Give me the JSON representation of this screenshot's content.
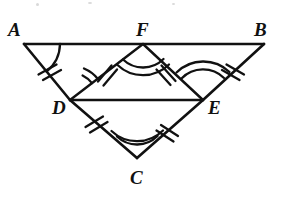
{
  "figure": {
    "stroke_color": "#111111",
    "background_color": "#ffffff",
    "points": {
      "A": {
        "x": 24,
        "y": 44,
        "label": "A",
        "label_x": 8,
        "label_y": 20
      },
      "B": {
        "x": 264,
        "y": 44,
        "label": "B",
        "label_x": 254,
        "label_y": 20
      },
      "C": {
        "x": 137,
        "y": 158,
        "label": "C",
        "label_x": 130,
        "label_y": 168
      },
      "D": {
        "x": 70,
        "y": 100,
        "label": "D",
        "label_x": 52,
        "label_y": 98
      },
      "E": {
        "x": 203,
        "y": 100,
        "label": "E",
        "label_x": 208,
        "label_y": 98
      },
      "F": {
        "x": 143,
        "y": 44,
        "label": "F",
        "label_x": 136,
        "label_y": 20
      }
    },
    "segments": [
      {
        "name": "segment-AB",
        "from": "A",
        "to": "B"
      },
      {
        "name": "segment-AD",
        "from": "A",
        "to": "D"
      },
      {
        "name": "segment-DC",
        "from": "D",
        "to": "C"
      },
      {
        "name": "segment-CE",
        "from": "C",
        "to": "E"
      },
      {
        "name": "segment-EB",
        "from": "E",
        "to": "B"
      },
      {
        "name": "segment-DE",
        "from": "D",
        "to": "E"
      },
      {
        "name": "segment-DF",
        "from": "D",
        "to": "F"
      },
      {
        "name": "segment-FE",
        "from": "F",
        "to": "E"
      }
    ],
    "tick_marks": [
      {
        "name": "tick-AD",
        "segment": "AD",
        "count": 2
      },
      {
        "name": "tick-DC",
        "segment": "DC",
        "count": 2
      },
      {
        "name": "tick-CE",
        "segment": "CE",
        "count": 2
      },
      {
        "name": "tick-EB",
        "segment": "EB",
        "count": 2
      },
      {
        "name": "tick-DF",
        "segment": "DF",
        "count": 2
      },
      {
        "name": "tick-FE",
        "segment": "FE",
        "count": 2
      }
    ],
    "angle_arcs": [
      {
        "name": "angle-A",
        "vertex": "A",
        "count": 1
      },
      {
        "name": "angle-ADF",
        "vertex": "D",
        "count": 2
      },
      {
        "name": "angle-DFE",
        "vertex": "F",
        "count": 2
      },
      {
        "name": "angle-FEB",
        "vertex": "E",
        "count": 2
      },
      {
        "name": "angle-DCE",
        "vertex": "C",
        "count": 2
      }
    ]
  }
}
